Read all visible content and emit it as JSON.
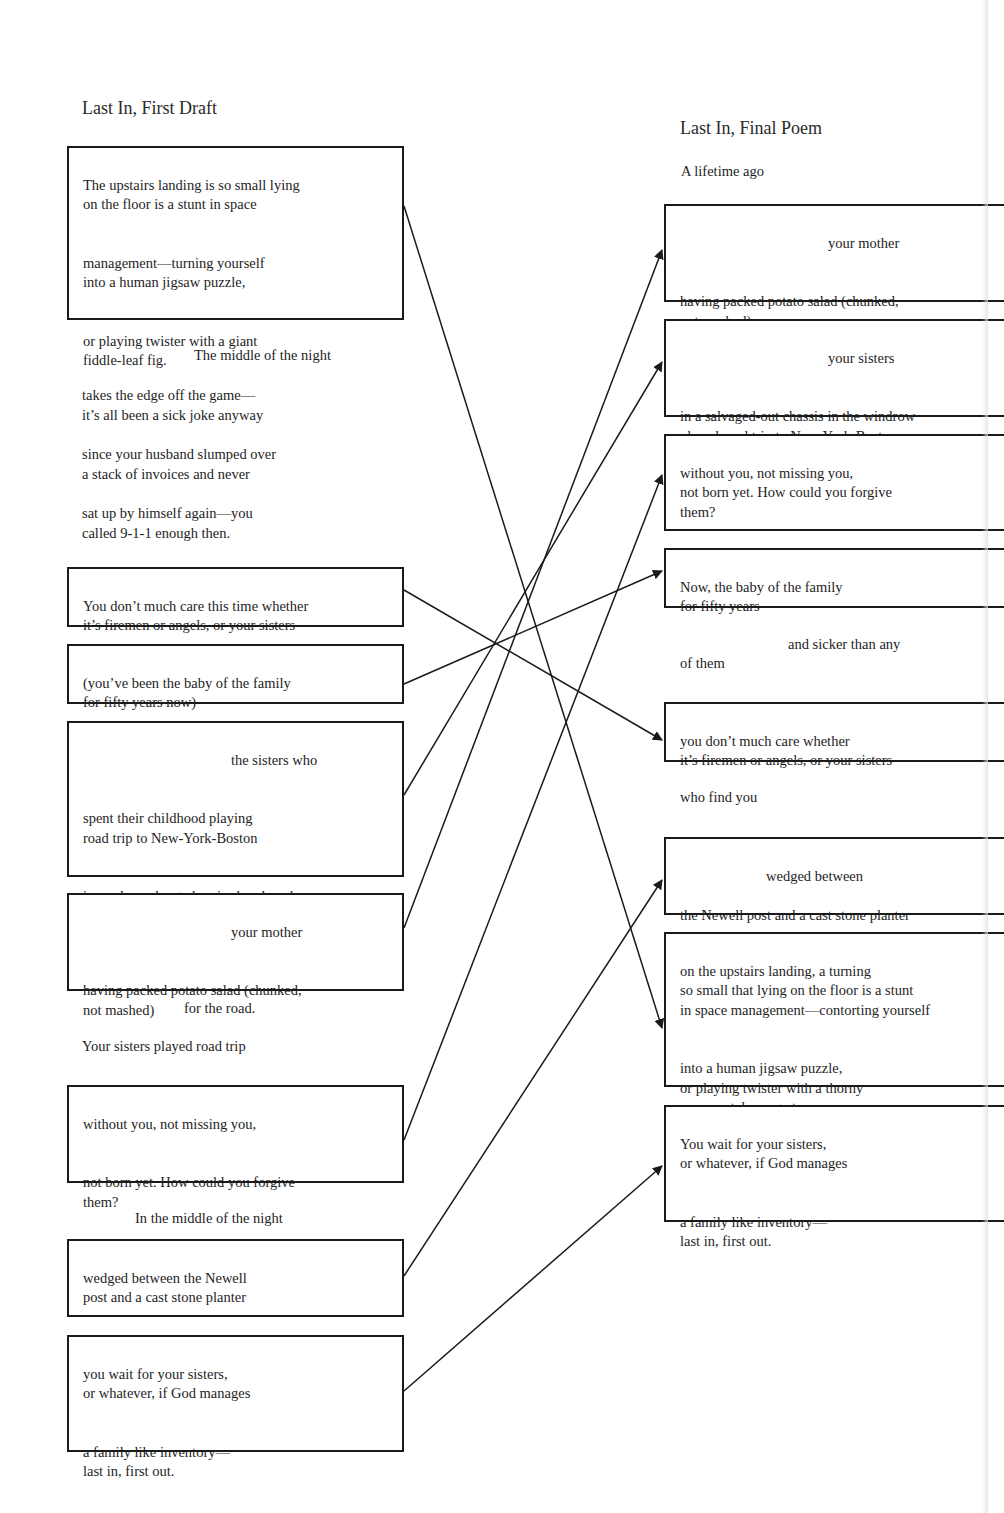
{
  "left": {
    "title": "Last In, First Draft",
    "boxes": [
      {
        "id": "L1",
        "stanzas": [
          "The upstairs landing is so small lying\non the floor is a stunt in space",
          "management—turning yourself\ninto a human jigsaw puzzle,",
          "or playing twister with a giant\nfiddle-leaf fig."
        ]
      },
      {
        "id": "L2",
        "stanzas": [
          "You don’t much care this time whether\nit’s firemen or angels, or your sisters"
        ]
      },
      {
        "id": "L3",
        "stanzas": [
          "(you’ve been the baby of the family\nfor fifty years now)"
        ]
      },
      {
        "id": "L4",
        "indented": "the sisters who",
        "stanzas": [
          "spent their childhood playing\nroad trip to New-York-Boston",
          "in a salvaged-out chassis abandoned\nin the woodrow,"
        ]
      },
      {
        "id": "L5",
        "indented": "your mother",
        "stanzas": [
          "having packed potato salad (chunked,\nnot mashed)"
        ]
      },
      {
        "id": "L6",
        "stanzas": [
          "without you, not missing you,",
          "not born yet.  How could you forgive\nthem?"
        ]
      },
      {
        "id": "L7",
        "stanzas": [
          "wedged between the Newell\npost and a cast stone planter"
        ]
      },
      {
        "id": "L8",
        "stanzas": [
          "you wait for your sisters,\nor whatever, if God manages",
          "a family like inventory—\nlast in, first out."
        ]
      }
    ],
    "free_text": {
      "middle_of_night_heading": "The middle of the night",
      "stanza_a": "takes the edge off the game—\nit’s all been a sick joke anyway",
      "stanza_b": "since your husband slumped over\na stack of invoices and never",
      "stanza_c": "sat up by himself again—you\ncalled 9-1-1 enough then.",
      "for_the_road": "for the road.",
      "sisters_played": "Your sisters played road trip",
      "in_the_middle": "In the middle of the night"
    }
  },
  "right": {
    "title": "Last In, Final Poem",
    "boxes": [
      {
        "id": "R1",
        "indented": "your mother",
        "stanzas": [
          "having packed potato salad (chunked,\nnot mashed)"
        ]
      },
      {
        "id": "R2",
        "indented": "your sisters",
        "stanzas": [
          "in a salvaged-out chassis in the windrow\nplayed road trip to New-York-Boston"
        ]
      },
      {
        "id": "R3",
        "stanzas": [
          "without you, not missing you,\nnot born yet.  How could you forgive\nthem?"
        ]
      },
      {
        "id": "R4",
        "stanzas": [
          "Now, the baby of the family\nfor fifty years"
        ]
      },
      {
        "id": "R5",
        "stanzas": [
          "you don’t much care whether\nit’s firemen or angels, or your sisters"
        ]
      },
      {
        "id": "R6",
        "indented": "wedged between",
        "stanzas": [
          "the Newell post and a cast stone planter"
        ]
      },
      {
        "id": "R7",
        "stanzas": [
          "on the upstairs landing, a turning\nso small that lying on the floor is a stunt\nin space management—contorting yourself",
          "into a human jigsaw puzzle,\nor playing twister with a thorny\nornamental orange tree."
        ]
      },
      {
        "id": "R8",
        "stanzas": [
          "You wait for your sisters,\nor whatever, if God manages",
          "a family like inventory—\nlast in, first out."
        ]
      }
    ],
    "free_text": {
      "lifetime_ago": "A lifetime ago",
      "sicker_indented": "and sicker than any",
      "of_them": "of them",
      "who_find_you": "who find you"
    }
  },
  "connections": [
    {
      "from": "L1",
      "to": "R7"
    },
    {
      "from": "L2",
      "to": "R5"
    },
    {
      "from": "L3",
      "to": "R4"
    },
    {
      "from": "L4",
      "to": "R2"
    },
    {
      "from": "L5",
      "to": "R1"
    },
    {
      "from": "L6",
      "to": "R3"
    },
    {
      "from": "L7",
      "to": "R6"
    },
    {
      "from": "L8",
      "to": "R8"
    }
  ],
  "colors": {
    "ink": "#1a1a1a",
    "paper": "#ffffff"
  }
}
